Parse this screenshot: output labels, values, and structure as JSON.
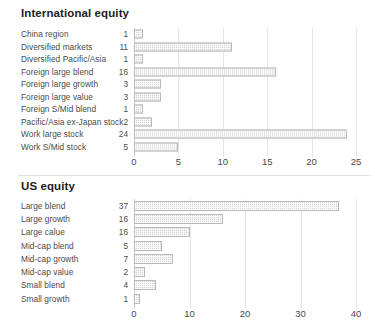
{
  "charts": [
    {
      "title": "International equity",
      "categories": [
        "China region",
        "Diversified markets",
        "Diversified Pacific/Asia",
        "Foreign large blend",
        "Foreign large growth",
        "Foreign large value",
        "Foreign S/Mid blend",
        "Pacific/Asia ex-Japan stock",
        "Work large stock",
        "Work S/Mid stock"
      ],
      "values": [
        1,
        11,
        1,
        16,
        3,
        3,
        1,
        2,
        24,
        5
      ],
      "bar_lengths": [
        1,
        11,
        1,
        16,
        3,
        3,
        1,
        2,
        24,
        5
      ],
      "ticks": [
        "0",
        "5",
        "10",
        "15",
        "20",
        "25"
      ]
    },
    {
      "title": "US equity",
      "categories": [
        "Large blend",
        "Large growth",
        "Large calue",
        "Mid-cap blend",
        "Mid-cap growth",
        "Mid-cap value",
        "Small blend",
        "Small growth"
      ],
      "values": [
        37,
        16,
        16,
        5,
        7,
        2,
        4,
        1
      ],
      "bar_lengths": [
        37,
        16,
        10,
        5,
        7,
        2,
        4,
        1
      ],
      "ticks": [
        "0",
        "10",
        "20",
        "30",
        "40"
      ]
    }
  ],
  "chart_data": [
    {
      "type": "bar",
      "orientation": "horizontal",
      "title": "International equity",
      "xlabel": "",
      "ylabel": "",
      "xlim": [
        0,
        25
      ],
      "xticks": [
        0,
        5,
        10,
        15,
        20,
        25
      ],
      "grid": "vertical",
      "legend": "none",
      "categories": [
        "China region",
        "Diversified markets",
        "Diversified Pacific/Asia",
        "Foreign large blend",
        "Foreign large growth",
        "Foreign large value",
        "Foreign S/Mid blend",
        "Pacific/Asia ex-Japan stock",
        "Work large stock",
        "Work S/Mid stock"
      ],
      "values": [
        1,
        11,
        1,
        16,
        3,
        3,
        1,
        2,
        24,
        5
      ],
      "data_labels": [
        "1",
        "11",
        "1",
        "16",
        "3",
        "3",
        "1",
        "2",
        "24",
        "5"
      ],
      "bar_color": "#d7d7d7"
    },
    {
      "type": "bar",
      "orientation": "horizontal",
      "title": "US equity",
      "xlabel": "",
      "ylabel": "",
      "xlim": [
        0,
        40
      ],
      "xticks": [
        0,
        10,
        20,
        30,
        40
      ],
      "grid": "vertical",
      "legend": "none",
      "categories": [
        "Large blend",
        "Large growth",
        "Large calue",
        "Mid-cap blend",
        "Mid-cap growth",
        "Mid-cap value",
        "Small blend",
        "Small growth"
      ],
      "values": [
        37,
        16,
        16,
        5,
        7,
        2,
        4,
        1
      ],
      "plotted_lengths": [
        37,
        16,
        10,
        5,
        7,
        2,
        4,
        1
      ],
      "data_labels": [
        "37",
        "16",
        "16",
        "5",
        "7",
        "2",
        "4",
        "1"
      ],
      "bar_color": "#d7d7d7",
      "note": "Row 'Large calue' is labeled 16 but its bar is drawn to 10."
    }
  ]
}
